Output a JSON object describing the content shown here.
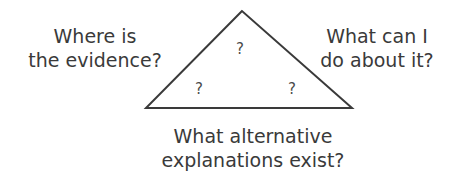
{
  "diagram": {
    "labels": {
      "left": [
        "Where is",
        "the evidence?"
      ],
      "right": [
        "What can I",
        "do about it?"
      ],
      "bottom": [
        "What alternative",
        "explanations exist?"
      ]
    },
    "inner_marks": {
      "top": "?",
      "bottom_left": "?",
      "bottom_right": "?"
    },
    "stroke_color": "#3a3a3a"
  }
}
